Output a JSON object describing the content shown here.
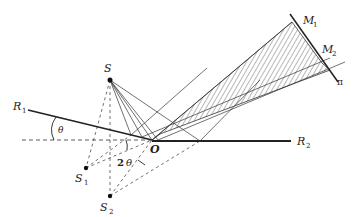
{
  "figure": {
    "labels": {
      "S": "S",
      "S1": "S",
      "S1_sub": "1",
      "S2": "S",
      "S2_sub": "2",
      "O": "O",
      "R1": "R",
      "R1_sub": "1",
      "R2": "R",
      "R2_sub": "2",
      "M1": "M",
      "M1_sub": "1",
      "M2": "M",
      "M2_sub": "2",
      "pi": "π",
      "theta": "θ",
      "two_theta_num": "2",
      "two_theta_sym": "θ"
    },
    "colors": {
      "ink": "#222222",
      "background": "#ffffff"
    }
  }
}
